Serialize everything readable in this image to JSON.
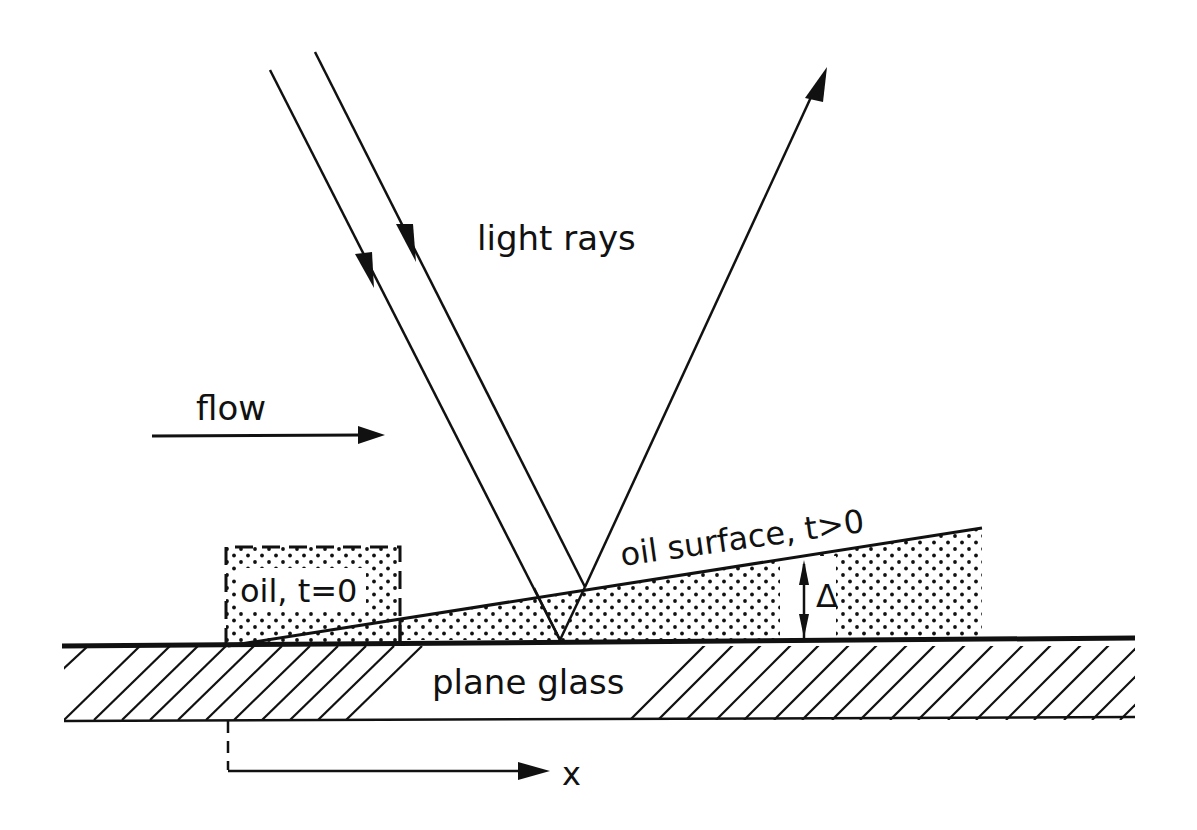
{
  "diagram": {
    "labels": {
      "light_rays": "light rays",
      "flow": "flow",
      "oil_initial": "oil, t=0",
      "oil_surface": "oil surface, t>0",
      "delta": "Δ",
      "plane_glass": "plane glass",
      "x_axis": "x"
    },
    "elements": [
      {
        "id": "incident-ray-1",
        "type": "arrow",
        "direction": "down"
      },
      {
        "id": "incident-ray-2",
        "type": "arrow",
        "direction": "down"
      },
      {
        "id": "reflected-ray",
        "type": "arrow",
        "direction": "up"
      },
      {
        "id": "flow-arrow",
        "type": "arrow",
        "direction": "right"
      },
      {
        "id": "oil-initial-box",
        "type": "dashed-rectangle",
        "fill": "dotted"
      },
      {
        "id": "oil-wedge",
        "type": "wedge",
        "fill": "dotted"
      },
      {
        "id": "thickness-marker",
        "type": "double-arrow",
        "label": "Δ"
      },
      {
        "id": "glass-plate",
        "type": "hatched-rectangle"
      },
      {
        "id": "x-axis",
        "type": "arrow",
        "direction": "right"
      }
    ],
    "colors": {
      "ink": "#111111",
      "background": "#ffffff"
    }
  }
}
